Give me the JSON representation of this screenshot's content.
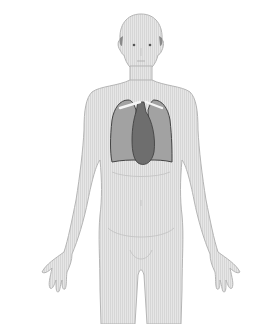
{
  "figure": {
    "highlighted_organs": [
      "lungs",
      "heart",
      "clavicles"
    ],
    "colors": {
      "background": "#ffffff",
      "body_fill": "#e4e4e4",
      "body_stroke": "#b0b0b0",
      "lung_fill": "#9a9a9a",
      "lung_stroke": "#4a4a4a",
      "heart_fill": "#707070",
      "clavicle": "#f4f4f4",
      "hair": "#808080"
    }
  }
}
